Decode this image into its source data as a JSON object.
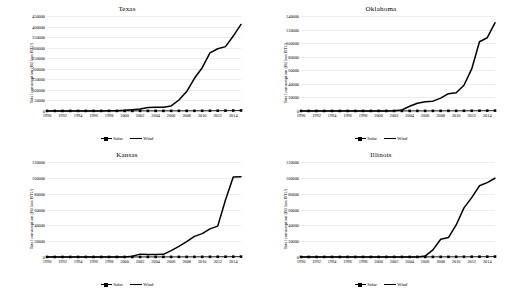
{
  "figure": {
    "ylabel": "Total consumption (Billion BTU)",
    "legend": {
      "solar": "Solar",
      "wind": "Wind"
    },
    "colors": {
      "line": "#000000",
      "grid": "#ededed",
      "background": "#ffffff"
    }
  },
  "chart_data": [
    {
      "type": "line",
      "title": "Texas",
      "xlabel": "",
      "ylabel": "Total consumption (Billion BTU)",
      "x": [
        1990,
        1991,
        1992,
        1993,
        1994,
        1995,
        1996,
        1997,
        1998,
        1999,
        2000,
        2001,
        2002,
        2003,
        2004,
        2005,
        2006,
        2007,
        2008,
        2009,
        2010,
        2011,
        2012,
        2013,
        2014,
        2015
      ],
      "xticks": [
        1990,
        1992,
        1994,
        1996,
        1998,
        2000,
        2002,
        2004,
        2006,
        2008,
        2010,
        2012,
        2014
      ],
      "ylim": [
        0,
        450000
      ],
      "yticks": [
        0,
        50000,
        100000,
        150000,
        200000,
        250000,
        300000,
        350000,
        400000,
        450000
      ],
      "grid": true,
      "legend_position": "bottom",
      "series": [
        {
          "name": "Solar",
          "marker": "square",
          "values": [
            400,
            420,
            430,
            450,
            460,
            470,
            480,
            500,
            520,
            540,
            560,
            580,
            600,
            620,
            640,
            660,
            700,
            750,
            800,
            900,
            1000,
            1200,
            1500,
            1800,
            2200,
            2600
          ]
        },
        {
          "name": "Wind",
          "marker": "none",
          "values": [
            300,
            320,
            340,
            360,
            380,
            400,
            450,
            500,
            600,
            1500,
            3000,
            6000,
            9000,
            17000,
            17500,
            18000,
            24000,
            52000,
            92000,
            155000,
            205000,
            275000,
            295000,
            305000,
            355000,
            410000
          ]
        }
      ]
    },
    {
      "type": "line",
      "title": "Oklahoma",
      "xlabel": "",
      "ylabel": "Total consumption (Billion BTU)",
      "x": [
        1990,
        1991,
        1992,
        1993,
        1994,
        1995,
        1996,
        1997,
        1998,
        1999,
        2000,
        2001,
        2002,
        2003,
        2004,
        2005,
        2006,
        2007,
        2008,
        2009,
        2010,
        2011,
        2012,
        2013,
        2014,
        2015
      ],
      "xticks": [
        1990,
        1992,
        1994,
        1996,
        1998,
        2000,
        2002,
        2004,
        2006,
        2008,
        2010,
        2012,
        2014
      ],
      "ylim": [
        0,
        140000
      ],
      "yticks": [
        0,
        20000,
        40000,
        60000,
        80000,
        100000,
        120000,
        140000
      ],
      "grid": true,
      "legend_position": "bottom",
      "series": [
        {
          "name": "Solar",
          "marker": "square",
          "values": [
            80,
            85,
            90,
            95,
            100,
            105,
            110,
            115,
            120,
            125,
            130,
            135,
            140,
            150,
            160,
            170,
            180,
            200,
            220,
            250,
            280,
            320,
            380,
            450,
            520,
            600
          ]
        },
        {
          "name": "Wind",
          "marker": "none",
          "values": [
            0,
            0,
            0,
            0,
            0,
            0,
            0,
            0,
            0,
            0,
            0,
            0,
            200,
            1500,
            7000,
            11500,
            13500,
            14500,
            19000,
            25500,
            27000,
            38000,
            62000,
            102000,
            108000,
            130000
          ]
        }
      ]
    },
    {
      "type": "line",
      "title": "Kansas",
      "xlabel": "",
      "ylabel": "Total consumption (Billion BTU)",
      "x": [
        1990,
        1991,
        1992,
        1993,
        1994,
        1995,
        1996,
        1997,
        1998,
        1999,
        2000,
        2001,
        2002,
        2003,
        2004,
        2005,
        2006,
        2007,
        2008,
        2009,
        2010,
        2011,
        2012,
        2013,
        2014,
        2015
      ],
      "xticks": [
        1990,
        1992,
        1994,
        1996,
        1998,
        2000,
        2002,
        2004,
        2006,
        2008,
        2010,
        2012,
        2014
      ],
      "ylim": [
        0,
        120000
      ],
      "yticks": [
        0,
        20000,
        40000,
        60000,
        80000,
        100000,
        120000
      ],
      "grid": true,
      "legend_position": "bottom",
      "series": [
        {
          "name": "Solar",
          "marker": "square",
          "values": [
            60,
            62,
            64,
            66,
            68,
            70,
            72,
            75,
            78,
            80,
            85,
            90,
            95,
            100,
            110,
            120,
            130,
            150,
            170,
            190,
            220,
            260,
            300,
            360,
            420,
            500
          ]
        },
        {
          "name": "Wind",
          "marker": "none",
          "values": [
            0,
            0,
            0,
            0,
            0,
            0,
            0,
            0,
            0,
            0,
            0,
            900,
            3600,
            3300,
            3200,
            3400,
            8000,
            13500,
            19500,
            26000,
            29500,
            35500,
            39000,
            72000,
            101000,
            101500
          ]
        }
      ]
    },
    {
      "type": "line",
      "title": "Illinois",
      "xlabel": "",
      "ylabel": "Total consumption (Billion BTU)",
      "x": [
        1990,
        1991,
        1992,
        1993,
        1994,
        1995,
        1996,
        1997,
        1998,
        1999,
        2000,
        2001,
        2002,
        2003,
        2004,
        2005,
        2006,
        2007,
        2008,
        2009,
        2010,
        2011,
        2012,
        2013,
        2014,
        2015
      ],
      "xticks": [
        1990,
        1992,
        1994,
        1996,
        1998,
        2000,
        2002,
        2004,
        2006,
        2008,
        2010,
        2012,
        2014
      ],
      "ylim": [
        0,
        120000
      ],
      "yticks": [
        0,
        20000,
        40000,
        60000,
        80000,
        100000,
        120000
      ],
      "grid": true,
      "legend_position": "bottom",
      "series": [
        {
          "name": "Solar",
          "marker": "square",
          "values": [
            70,
            72,
            74,
            76,
            78,
            80,
            85,
            90,
            95,
            100,
            105,
            110,
            115,
            120,
            130,
            140,
            150,
            170,
            190,
            210,
            240,
            280,
            330,
            390,
            460,
            540
          ]
        },
        {
          "name": "Wind",
          "marker": "none",
          "values": [
            0,
            0,
            0,
            0,
            0,
            0,
            0,
            0,
            0,
            0,
            0,
            0,
            0,
            0,
            0,
            100,
            1200,
            9000,
            22500,
            24500,
            40500,
            62000,
            75000,
            90000,
            94000,
            99500
          ]
        }
      ]
    }
  ]
}
